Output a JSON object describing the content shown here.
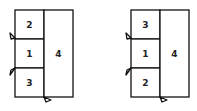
{
  "figures": [
    {
      "name": "left-layout",
      "cells": [
        {
          "label": "2",
          "position": "top-left"
        },
        {
          "label": "1",
          "position": "middle-left"
        },
        {
          "label": "3",
          "position": "bottom-left"
        },
        {
          "label": "4",
          "position": "right-full"
        }
      ],
      "markers": [
        "left-edge-row1-bottom",
        "left-edge-row2-bottom",
        "bottom-edge-divider"
      ]
    },
    {
      "name": "right-layout",
      "cells": [
        {
          "label": "3",
          "position": "top-left"
        },
        {
          "label": "1",
          "position": "middle-left"
        },
        {
          "label": "2",
          "position": "bottom-left"
        },
        {
          "label": "4",
          "position": "right-full"
        }
      ],
      "markers": [
        "left-edge-row1-bottom",
        "left-edge-row2-bottom",
        "bottom-edge-divider"
      ]
    }
  ]
}
